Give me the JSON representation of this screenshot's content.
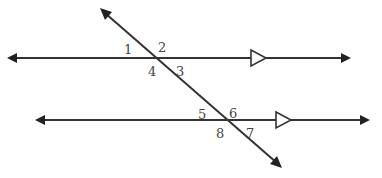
{
  "diagram": {
    "colors": {
      "line": "#333333",
      "label": "#444444",
      "background": "#ffffff"
    },
    "lines": {
      "top": {
        "y": 58,
        "x1": 8,
        "x2": 350,
        "parallel_marker_x": 251
      },
      "bottom": {
        "y": 120,
        "x1": 36,
        "x2": 369,
        "parallel_marker_x": 276
      },
      "transversal": {
        "x1": 101,
        "y1": 9,
        "x2": 281,
        "y2": 167
      }
    },
    "angle_labels": [
      {
        "text": "1",
        "x": 124,
        "y": 54
      },
      {
        "text": "2",
        "x": 158,
        "y": 52
      },
      {
        "text": "4",
        "x": 148,
        "y": 76
      },
      {
        "text": "3",
        "x": 176,
        "y": 76
      },
      {
        "text": "5",
        "x": 198,
        "y": 119
      },
      {
        "text": "6",
        "x": 229,
        "y": 118
      },
      {
        "text": "8",
        "x": 216,
        "y": 138
      },
      {
        "text": "7",
        "x": 246,
        "y": 138
      }
    ]
  }
}
